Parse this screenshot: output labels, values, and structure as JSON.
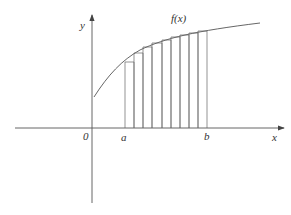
{
  "diagram": {
    "type": "riemann-sum",
    "labels": {
      "function": "f(x)",
      "y_axis": "y",
      "x_axis": "x",
      "origin": "0",
      "a": "a",
      "b": "b"
    },
    "rectangle_count": 9,
    "rectangle_type": "left-endpoint (inscribed)",
    "colors": {
      "line": "#555555",
      "background": "#ffffff"
    }
  }
}
